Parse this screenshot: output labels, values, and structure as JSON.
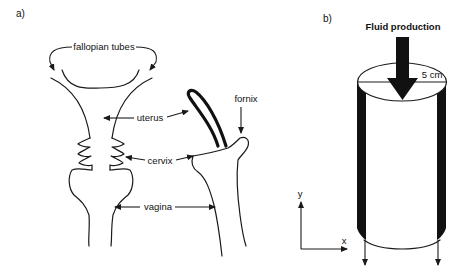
{
  "panel_a": {
    "label": "a)",
    "annotations": {
      "fallopian_tubes": "fallopian tubes",
      "uterus": "uterus",
      "cervix": "cervix",
      "vagina": "vagina",
      "fornix": "fornix"
    }
  },
  "panel_b": {
    "label": "b)",
    "arrow_label": "Fluid production",
    "dimension_label": "5 cm",
    "axes": {
      "x": "x",
      "y": "y"
    }
  },
  "colors": {
    "line": "#1a1a1a",
    "fill_dark": "#111111",
    "background": "#ffffff"
  }
}
